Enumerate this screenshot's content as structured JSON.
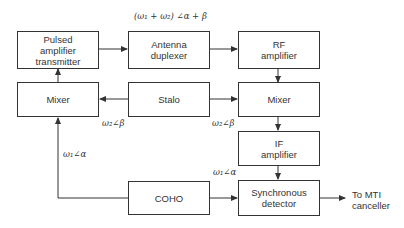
{
  "diagram": {
    "type": "block-diagram",
    "blocks": {
      "transmitter": {
        "line1": "Pulsed",
        "line2": "amplifier",
        "line3": "transmitter"
      },
      "duplexer": {
        "line1": "Antenna",
        "line2": "duplexer"
      },
      "rf_amp": {
        "line1": "RF",
        "line2": "amplifier"
      },
      "mixer_left": {
        "label": "Mixer"
      },
      "stalo": {
        "label": "Stalo"
      },
      "mixer_right": {
        "label": "Mixer"
      },
      "if_amp": {
        "line1": "IF",
        "line2": "amplifier"
      },
      "coho": {
        "label": "COHO"
      },
      "sync_det": {
        "line1": "Synchronous",
        "line2": "detector"
      }
    },
    "signal_labels": {
      "tx_signal": "(ω₁ + ω₂) ∠α + β",
      "stalo_left": "ω₂∠β",
      "stalo_right": "ω₂∠β",
      "coho_left": "ω₁∠α",
      "coho_right": "ω₁∠α"
    },
    "output": {
      "line1": "To MTI",
      "line2": "canceller"
    },
    "connections": [
      {
        "from": "Pulsed amplifier transmitter",
        "to": "Antenna duplexer"
      },
      {
        "from": "Antenna duplexer",
        "to": "RF amplifier"
      },
      {
        "from": "RF amplifier",
        "to": "Mixer (right)"
      },
      {
        "from": "Stalo",
        "to": "Mixer (left)"
      },
      {
        "from": "Stalo",
        "to": "Mixer (right)"
      },
      {
        "from": "Mixer (left)",
        "to": "Pulsed amplifier transmitter"
      },
      {
        "from": "Mixer (right)",
        "to": "IF amplifier"
      },
      {
        "from": "IF amplifier",
        "to": "Synchronous detector"
      },
      {
        "from": "COHO",
        "to": "Mixer (left)"
      },
      {
        "from": "COHO",
        "to": "Synchronous detector"
      },
      {
        "from": "Synchronous detector",
        "to": "To MTI canceller"
      }
    ]
  }
}
